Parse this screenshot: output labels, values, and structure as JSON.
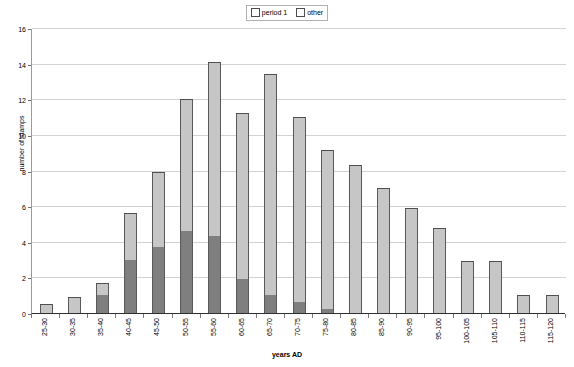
{
  "chart_data": {
    "type": "bar",
    "stacked": true,
    "title": "",
    "xlabel": "years AD",
    "ylabel": "number of stamps",
    "ylim": [
      0,
      16
    ],
    "ytick_step": 2,
    "yticks": [
      0,
      2,
      4,
      6,
      8,
      10,
      12,
      14,
      16
    ],
    "grid": true,
    "legend_position": "top-center",
    "legend": [
      "period 1",
      "other"
    ],
    "categories": [
      "25-30",
      "30-35",
      "35-40",
      "40-45",
      "45-50",
      "50-55",
      "55-60",
      "60-65",
      "65-70",
      "70-75",
      "75-80",
      "80-85",
      "85-90",
      "90-95",
      "95-100",
      "100-105",
      "105-110",
      "110-115",
      "115-120"
    ],
    "series": [
      {
        "name": "period 1",
        "color": "#7f7f7f",
        "values": [
          0,
          0,
          1.0,
          3.0,
          3.7,
          4.6,
          4.35,
          1.9,
          1.0,
          0.6,
          0.2,
          0,
          0,
          0,
          0,
          0,
          0,
          0,
          0
        ]
      },
      {
        "name": "other",
        "color": "#c6c6c6",
        "values": [
          0.5,
          0.9,
          0.7,
          2.6,
          4.2,
          7.4,
          9.75,
          9.35,
          12.4,
          10.4,
          8.95,
          8.3,
          7.0,
          5.9,
          4.8,
          2.9,
          2.9,
          1.0,
          1.0
        ]
      }
    ],
    "totals": [
      0.5,
      0.9,
      1.7,
      5.6,
      7.9,
      12.0,
      14.1,
      11.25,
      13.4,
      11.0,
      9.15,
      8.3,
      7.0,
      5.9,
      4.8,
      2.9,
      2.9,
      1.0,
      1.0
    ]
  }
}
